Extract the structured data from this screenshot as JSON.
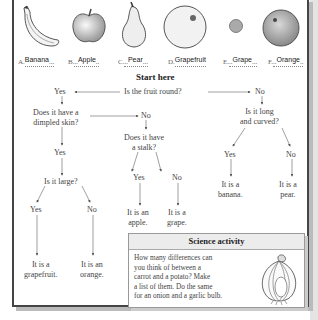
{
  "fruits": [
    {
      "letter": "A.",
      "answer": "Banana",
      "icon": "banana-icon"
    },
    {
      "letter": "B.",
      "answer": "Apple",
      "icon": "apple-icon"
    },
    {
      "letter": "C.",
      "answer": "Pear",
      "icon": "pear-icon"
    },
    {
      "letter": "D.",
      "answer": "Grapefruit",
      "icon": "grapefruit-icon"
    },
    {
      "letter": "E.",
      "answer": "Grape",
      "icon": "grape-icon"
    },
    {
      "letter": "F.",
      "answer": "Orange",
      "icon": "orange-icon"
    }
  ],
  "flowchart": {
    "start": "Start here",
    "q_round": "Is the fruit round?",
    "yes_round": "Yes",
    "no_round": "No",
    "q_dimpled_1": "Does it have a",
    "q_dimpled_2": "dimpled skin?",
    "no_dimpled": "No",
    "yes_dimpled": "Yes",
    "q_stalk_1": "Does it have",
    "q_stalk_2": "a stalk?",
    "yes_stalk": "Yes",
    "no_stalk": "No",
    "res_apple_1": "It is an",
    "res_apple_2": "apple.",
    "res_grape_1": "It is a",
    "res_grape_2": "grape.",
    "q_large": "Is it large?",
    "yes_large": "Yes",
    "no_large": "No",
    "res_grapefruit_1": "It is a",
    "res_grapefruit_2": "grapefruit.",
    "res_orange_1": "It is an",
    "res_orange_2": "orange.",
    "q_long_1": "Is it long",
    "q_long_2": "and curved?",
    "yes_long": "Yes",
    "no_long": "No",
    "res_banana_1": "It is a",
    "res_banana_2": "banana.",
    "res_pear_1": "It is a",
    "res_pear_2": "pear."
  },
  "science": {
    "title": "Science activity",
    "lines": [
      "How many differences can",
      "you think of between a",
      "carrot and a potato? Make",
      "a list of them. Do the same",
      "for an onion and a garlic bulb."
    ],
    "icon": "garlic-bulb-icon"
  }
}
